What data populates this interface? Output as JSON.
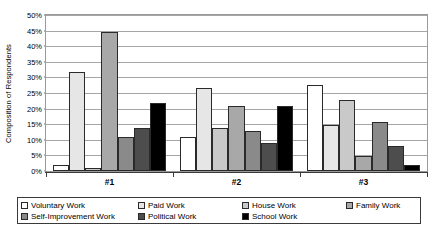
{
  "chart_data": {
    "type": "bar",
    "title": "",
    "subtitle": "",
    "xlabel": "",
    "ylabel": "Composition of Respondents",
    "categories": [
      "#1",
      "#2",
      "#3"
    ],
    "ylim": [
      0,
      50
    ],
    "y_tick_labels": [
      "0%",
      "5%",
      "10%",
      "15%",
      "20%",
      "25%",
      "30%",
      "35%",
      "40%",
      "45%",
      "50%"
    ],
    "y_tick_values": [
      0,
      5,
      10,
      15,
      20,
      25,
      30,
      35,
      40,
      45,
      50
    ],
    "y_unit": "%",
    "grid": true,
    "grid_axis": "y",
    "legend_position": "bottom",
    "legend_columns": 4,
    "series": [
      {
        "name": "Voluntary Work",
        "color": "#ffffff",
        "values": [
          2,
          11,
          28
        ]
      },
      {
        "name": "Paid Work",
        "color": "#e6e6e6",
        "values": [
          32,
          27,
          15
        ]
      },
      {
        "name": "House Work",
        "color": "#c9c9c9",
        "values": [
          1,
          14,
          23
        ]
      },
      {
        "name": "Family Work",
        "color": "#a8a8a8",
        "values": [
          45,
          21,
          5
        ]
      },
      {
        "name": "Self-Improvement Work",
        "color": "#8a8a8a",
        "values": [
          11,
          13,
          16
        ]
      },
      {
        "name": "Political Work",
        "color": "#4d4d4d",
        "values": [
          14,
          9,
          8
        ]
      },
      {
        "name": "School Work",
        "color": "#000000",
        "values": [
          22,
          21,
          2
        ]
      }
    ]
  },
  "legend": {
    "rows": [
      [
        {
          "label": "Voluntary Work",
          "swatch": "#ffffff"
        },
        {
          "label": "Paid Work",
          "swatch": "#e6e6e6"
        },
        {
          "label": "House Work",
          "swatch": "#c9c9c9"
        },
        {
          "label": "Family Work",
          "swatch": "#a8a8a8"
        }
      ],
      [
        {
          "label": "Self-Improvement Work",
          "swatch": "#8a8a8a"
        },
        {
          "label": "Political Work",
          "swatch": "#4d4d4d"
        },
        {
          "label": "School Work",
          "swatch": "#000000"
        }
      ]
    ]
  },
  "colors": {
    "plot_border": "#9a9a9a",
    "gridline": "#a6a6a6",
    "axis": "#3a3a3a",
    "bar_outline": "#2a2a2a",
    "background": "#ffffff"
  }
}
